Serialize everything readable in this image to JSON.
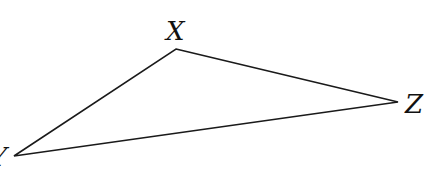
{
  "diagram": {
    "type": "triangle",
    "stroke_color": "#1a1a1a",
    "vertices": [
      {
        "label": "X",
        "x": 176,
        "y": 49,
        "label_x": 166,
        "label_y": 40
      },
      {
        "label": "Z",
        "x": 398,
        "y": 102,
        "label_x": 405,
        "label_y": 113
      },
      {
        "label": "Y",
        "x": 14,
        "y": 156,
        "label_x": -10,
        "label_y": 166
      }
    ]
  }
}
